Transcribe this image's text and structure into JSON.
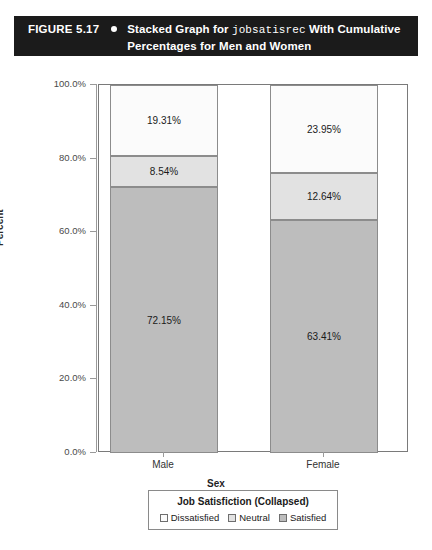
{
  "figure": {
    "number": "FIGURE 5.17",
    "bullet_icon": "bullet-dot-icon",
    "caption_prefix": "Stacked Graph for ",
    "caption_variable": "jobsatisrec",
    "caption_suffix": " With Cumulative Percentages for Men and Women",
    "bar_background": "#1b1b1b",
    "bar_text_color": "#ffffff"
  },
  "chart_data": {
    "type": "bar",
    "subtype": "stacked-100-percent",
    "title": "Stacked Graph for jobsatisrec With Cumulative Percentages for Men and Women",
    "xlabel": "Sex",
    "ylabel": "Percent",
    "categories": [
      "Male",
      "Female"
    ],
    "ylim": [
      0,
      100
    ],
    "ytick_labels": [
      "0.0%",
      "20.0%",
      "40.0%",
      "60.0%",
      "80.0%",
      "100.0%"
    ],
    "ytick_values": [
      0,
      20,
      40,
      60,
      80,
      100
    ],
    "grid": false,
    "legend_position": "bottom",
    "legend_title": "Job Satisfiction (Collapsed)",
    "series": [
      {
        "name": "Satisfied",
        "color": "#bdbdbd",
        "values": [
          72.15,
          63.41
        ],
        "labels": [
          "72.15%",
          "63.41%"
        ]
      },
      {
        "name": "Neutral",
        "color": "#e2e2e2",
        "values": [
          8.54,
          12.64
        ],
        "labels": [
          "8.54%",
          "12.64%"
        ]
      },
      {
        "name": "Dissatisfied",
        "color": "#fbfbfb",
        "values": [
          19.31,
          23.95
        ],
        "labels": [
          "19.31%",
          "23.95%"
        ]
      }
    ]
  },
  "legend": {
    "title": "Job Satisfiction (Collapsed)",
    "items": [
      {
        "label": "Dissatisfied",
        "color": "#fbfbfb"
      },
      {
        "label": "Neutral",
        "color": "#e2e2e2"
      },
      {
        "label": "Satisfied",
        "color": "#bdbdbd"
      }
    ]
  }
}
